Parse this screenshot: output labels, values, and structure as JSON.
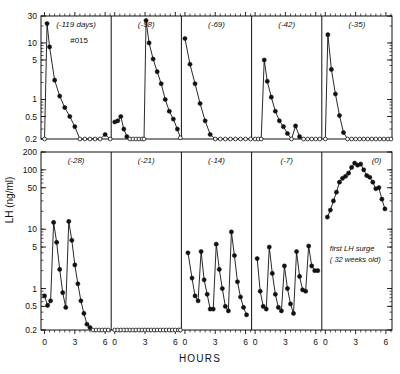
{
  "figure": {
    "ylabel": "LH (ng/ml)",
    "xlabel": "HOURS",
    "subject_id": "#015",
    "annotation_line1": "first LH surge",
    "annotation_line2": "( 32 weeks old)",
    "line_color": "#111111",
    "marker_filled_color": "#111111",
    "marker_open_color": "#ffffff"
  },
  "chart_data": {
    "type": "line",
    "title": "",
    "subtitle": "",
    "xlabel": "HOURS",
    "ylabel": "LH (ng/ml)",
    "yscale": "log",
    "grid": false,
    "legend": null,
    "annotations": [
      {
        "panel": "(-119 days)",
        "text": "#015"
      },
      {
        "panel": "(0)",
        "text": "first LH surge ( 32 weeks old)"
      }
    ],
    "row_axes": [
      {
        "row": 0,
        "ylim": [
          0.2,
          30
        ],
        "ytick_labels": [
          "30",
          "10",
          "5",
          "1",
          "0.5",
          "0.2"
        ],
        "ytick_values": [
          30,
          10,
          5,
          1,
          0.5,
          0.2
        ]
      },
      {
        "row": 1,
        "ylim": [
          0.2,
          200
        ],
        "ytick_labels": [
          "200",
          "100",
          "50",
          "10",
          "5",
          "1",
          "0.5",
          "0.2"
        ],
        "ytick_values": [
          200,
          100,
          50,
          10,
          5,
          1,
          0.5,
          0.2
        ]
      }
    ],
    "xlim": [
      -0.35,
      6.6
    ],
    "xtick_labels": [
      "0",
      "3",
      "6"
    ],
    "xtick_values": [
      0,
      3,
      6
    ],
    "xminor_step": 0.5,
    "detection_limit": 0.2,
    "panels": [
      {
        "label": "(-119 days)",
        "row": 0,
        "col": 0,
        "x": [
          0,
          0.25,
          0.5,
          1,
          1.5,
          2,
          2.5,
          3,
          3.5,
          4,
          4.5,
          5,
          5.5,
          6,
          6.5
        ],
        "y": [
          0.2,
          22,
          8.5,
          2.2,
          1.15,
          0.72,
          0.5,
          0.33,
          0.2,
          0.2,
          0.2,
          0.2,
          0.2,
          0.24,
          0.2
        ],
        "open": [
          true,
          false,
          false,
          false,
          false,
          false,
          false,
          false,
          true,
          true,
          true,
          true,
          true,
          false,
          true
        ]
      },
      {
        "label": "(-98)",
        "row": 0,
        "col": 1,
        "x": [
          0,
          0.3,
          0.6,
          0.9,
          1.2,
          1.5,
          1.8,
          2.1,
          2.4,
          2.7,
          2.9,
          3.1,
          3.4,
          3.8,
          4.2,
          4.6,
          5.0,
          5.4,
          5.8,
          6.2,
          6.5
        ],
        "y": [
          0.4,
          0.42,
          0.5,
          0.3,
          0.22,
          0.2,
          0.2,
          0.2,
          0.2,
          0.2,
          0.2,
          25,
          10,
          5.2,
          3.1,
          1.9,
          1.0,
          0.62,
          0.45,
          0.3,
          0.21
        ],
        "open": [
          false,
          false,
          false,
          false,
          false,
          true,
          true,
          true,
          true,
          true,
          true,
          false,
          false,
          false,
          false,
          false,
          false,
          false,
          false,
          false,
          true
        ]
      },
      {
        "label": "(-69)",
        "row": 0,
        "col": 2,
        "x": [
          0,
          0.5,
          1,
          1.5,
          2,
          2.5,
          3,
          3.5,
          4,
          4.5,
          5,
          5.5,
          6,
          6.5
        ],
        "y": [
          12,
          4.2,
          1.9,
          0.85,
          0.42,
          0.24,
          0.2,
          0.2,
          0.2,
          0.2,
          0.2,
          0.2,
          0.2,
          0.2
        ],
        "open": [
          false,
          false,
          false,
          false,
          false,
          false,
          true,
          true,
          true,
          true,
          true,
          true,
          true,
          true
        ]
      },
      {
        "label": "(-42)",
        "row": 0,
        "col": 3,
        "x": [
          0,
          0.3,
          0.6,
          0.9,
          1.2,
          1.6,
          2.0,
          2.4,
          2.8,
          3.2,
          3.6,
          4.0,
          4.4,
          4.8,
          5.2,
          5.6,
          6.0,
          6.4
        ],
        "y": [
          0.2,
          0.2,
          0.2,
          5.0,
          2.1,
          1.1,
          0.62,
          0.42,
          0.33,
          0.25,
          0.2,
          0.34,
          0.22,
          0.2,
          0.2,
          0.2,
          0.2,
          0.2
        ],
        "open": [
          true,
          true,
          true,
          false,
          false,
          false,
          false,
          false,
          false,
          false,
          true,
          false,
          false,
          true,
          true,
          true,
          true,
          true
        ]
      },
      {
        "label": "(-35)",
        "row": 0,
        "col": 4,
        "x": [
          0,
          0.25,
          0.6,
          1.0,
          1.4,
          1.8,
          2.2,
          2.6,
          3.0,
          3.4,
          3.8,
          4.2,
          4.6,
          5.0,
          5.4,
          5.8,
          6.2,
          6.5
        ],
        "y": [
          0.2,
          14,
          3.4,
          1.25,
          0.52,
          0.26,
          0.2,
          0.2,
          0.2,
          0.2,
          0.2,
          0.2,
          0.2,
          0.2,
          0.2,
          0.2,
          0.2,
          0.2
        ],
        "open": [
          true,
          false,
          false,
          false,
          false,
          false,
          true,
          true,
          true,
          true,
          true,
          true,
          true,
          true,
          true,
          true,
          true,
          true
        ]
      },
      {
        "label": "(-28)",
        "row": 1,
        "col": 0,
        "x": [
          0,
          0.3,
          0.6,
          0.9,
          1.2,
          1.5,
          1.8,
          2.1,
          2.4,
          2.7,
          3.0,
          3.3,
          3.6,
          3.9,
          4.2,
          4.5,
          4.8,
          5.1,
          5.4,
          5.7,
          6.0,
          6.3
        ],
        "y": [
          0.75,
          0.52,
          0.62,
          13,
          6.0,
          2.1,
          0.85,
          0.48,
          13.5,
          6.5,
          2.5,
          1.2,
          0.62,
          0.38,
          0.25,
          0.22,
          0.2,
          0.2,
          0.2,
          0.2,
          0.2,
          0.2
        ],
        "open": [
          false,
          false,
          false,
          false,
          false,
          false,
          false,
          false,
          false,
          false,
          false,
          false,
          false,
          false,
          false,
          false,
          true,
          true,
          true,
          true,
          true,
          true
        ]
      },
      {
        "label": "(-21)",
        "row": 1,
        "col": 1,
        "x": [
          0,
          0.3,
          0.6,
          0.9,
          1.2,
          1.5,
          1.8,
          2.1,
          2.4,
          2.7,
          3.0,
          3.3,
          3.6,
          3.9,
          4.2,
          4.5,
          4.8,
          5.1,
          5.4,
          5.7,
          6.0,
          6.3,
          6.5
        ],
        "y": [
          0.2,
          0.2,
          0.2,
          0.2,
          0.2,
          0.2,
          0.2,
          0.2,
          0.2,
          0.2,
          0.2,
          0.2,
          0.2,
          0.2,
          0.2,
          0.2,
          0.2,
          0.2,
          0.2,
          0.2,
          0.2,
          0.2,
          0.2
        ],
        "open": [
          true,
          true,
          true,
          true,
          true,
          true,
          true,
          true,
          true,
          true,
          true,
          true,
          true,
          true,
          true,
          true,
          true,
          true,
          true,
          true,
          true,
          true,
          true
        ]
      },
      {
        "label": "(-14)",
        "row": 1,
        "col": 2,
        "x": [
          0.3,
          0.7,
          1.0,
          1.3,
          1.6,
          1.9,
          2.2,
          2.5,
          2.8,
          3.1,
          3.4,
          3.7,
          4.0,
          4.3,
          4.6,
          4.9,
          5.2,
          5.5,
          5.8,
          6.1
        ],
        "y": [
          4.0,
          1.5,
          0.75,
          0.62,
          4.2,
          1.4,
          0.8,
          0.45,
          0.45,
          5.6,
          2.1,
          1.0,
          0.5,
          0.42,
          9.0,
          3.6,
          1.3,
          0.72,
          0.48,
          0.36
        ],
        "open": [
          false,
          false,
          false,
          false,
          false,
          false,
          false,
          false,
          false,
          false,
          false,
          false,
          false,
          false,
          false,
          false,
          false,
          false,
          false,
          false
        ]
      },
      {
        "label": "(-7)",
        "row": 1,
        "col": 3,
        "x": [
          0.2,
          0.5,
          0.8,
          1.1,
          1.4,
          1.7,
          2.0,
          2.3,
          2.6,
          2.9,
          3.2,
          3.5,
          3.8,
          4.1,
          4.4,
          4.7,
          5.0,
          5.3,
          5.6,
          5.9,
          6.2
        ],
        "y": [
          3.2,
          0.9,
          0.5,
          0.45,
          5.0,
          1.8,
          0.8,
          0.48,
          0.42,
          2.4,
          1.0,
          0.55,
          0.38,
          4.2,
          1.6,
          0.95,
          0.9,
          5.2,
          2.4,
          2.0,
          2.0
        ],
        "open": [
          false,
          false,
          false,
          false,
          false,
          false,
          false,
          false,
          false,
          false,
          false,
          false,
          false,
          false,
          false,
          false,
          false,
          false,
          false,
          false,
          false
        ]
      },
      {
        "label": "(0)",
        "row": 1,
        "col": 4,
        "x": [
          0.2,
          0.5,
          0.8,
          1.1,
          1.4,
          1.7,
          2.0,
          2.3,
          2.6,
          2.9,
          3.2,
          3.5,
          3.8,
          4.1,
          4.4,
          4.7,
          5.0,
          5.3,
          5.6,
          5.9
        ],
        "y": [
          16,
          21,
          30,
          42,
          62,
          72,
          78,
          88,
          110,
          130,
          120,
          125,
          100,
          80,
          75,
          62,
          48,
          50,
          32,
          22
        ],
        "open": [
          false,
          false,
          false,
          false,
          false,
          false,
          false,
          false,
          false,
          false,
          false,
          false,
          false,
          false,
          false,
          false,
          false,
          false,
          false,
          false
        ]
      }
    ]
  }
}
